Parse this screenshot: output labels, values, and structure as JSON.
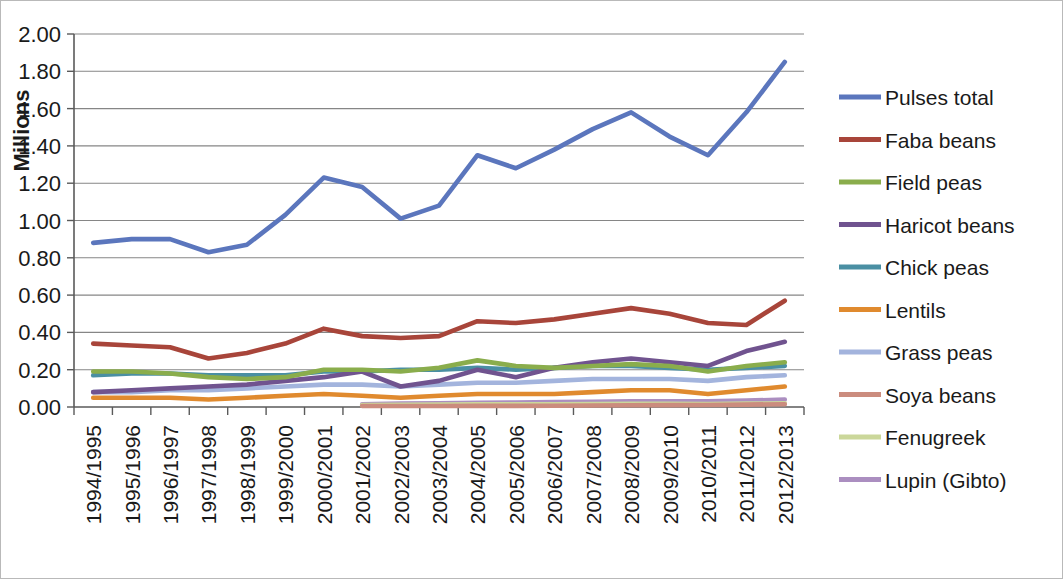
{
  "chart_data": {
    "type": "line",
    "title": "",
    "xlabel": "",
    "ylabel": "Millions",
    "ylim": [
      0.0,
      2.0
    ],
    "ytick_step": 0.2,
    "ytick_labels": [
      "0.00",
      "0.20",
      "0.40",
      "0.60",
      "0.80",
      "1.00",
      "1.20",
      "1.40",
      "1.60",
      "1.80",
      "2.00"
    ],
    "grid": true,
    "legend_position": "right",
    "categories": [
      "1994/1995",
      "1995/1996",
      "1996/1997",
      "1997/1998",
      "1998/1999",
      "1999/2000",
      "2000/2001",
      "2001/2002",
      "2002/2003",
      "2003/2004",
      "2004/2005",
      "2005/2006",
      "2006/2007",
      "2007/2008",
      "2008/2009",
      "2009/2010",
      "2010/2011",
      "2011/2012",
      "2012/2013"
    ],
    "series": [
      {
        "name": "Pulses total",
        "color": "#5b76bd",
        "values": [
          0.88,
          0.9,
          0.9,
          0.83,
          0.87,
          1.03,
          1.23,
          1.18,
          1.01,
          1.08,
          1.35,
          1.28,
          1.38,
          1.49,
          1.58,
          1.45,
          1.35,
          1.58,
          1.85
        ]
      },
      {
        "name": "Faba beans",
        "color": "#a8453a",
        "values": [
          0.34,
          0.33,
          0.32,
          0.26,
          0.29,
          0.34,
          0.42,
          0.38,
          0.37,
          0.38,
          0.46,
          0.45,
          0.47,
          0.5,
          0.53,
          0.5,
          0.45,
          0.44,
          0.57
        ]
      },
      {
        "name": "Field peas",
        "color": "#8aad4c",
        "values": [
          0.19,
          0.19,
          0.18,
          0.16,
          0.15,
          0.16,
          0.2,
          0.2,
          0.19,
          0.21,
          0.25,
          0.22,
          0.21,
          0.22,
          0.23,
          0.22,
          0.19,
          0.22,
          0.24
        ]
      },
      {
        "name": "Haricot beans",
        "color": "#70538f",
        "values": [
          0.08,
          0.09,
          0.1,
          0.11,
          0.12,
          0.14,
          0.16,
          0.19,
          0.11,
          0.14,
          0.2,
          0.16,
          0.21,
          0.24,
          0.26,
          0.24,
          0.22,
          0.3,
          0.35
        ]
      },
      {
        "name": "Chick peas",
        "color": "#4a8fa3",
        "values": [
          0.17,
          0.18,
          0.18,
          0.17,
          0.17,
          0.17,
          0.19,
          0.19,
          0.2,
          0.2,
          0.21,
          0.2,
          0.21,
          0.22,
          0.22,
          0.21,
          0.2,
          0.21,
          0.22
        ]
      },
      {
        "name": "Lentils",
        "color": "#e08a2e",
        "values": [
          0.05,
          0.05,
          0.05,
          0.04,
          0.05,
          0.06,
          0.07,
          0.06,
          0.05,
          0.06,
          0.07,
          0.07,
          0.07,
          0.08,
          0.09,
          0.09,
          0.07,
          0.09,
          0.11
        ]
      },
      {
        "name": "Grass peas",
        "color": "#a3b4dd",
        "values": [
          0.08,
          0.08,
          0.09,
          0.09,
          0.1,
          0.11,
          0.12,
          0.12,
          0.11,
          0.12,
          0.13,
          0.13,
          0.14,
          0.15,
          0.15,
          0.15,
          0.14,
          0.16,
          0.17
        ]
      },
      {
        "name": "Soya beans",
        "color": "#cb8c7e",
        "values": [
          null,
          null,
          null,
          null,
          null,
          null,
          null,
          0.005,
          0.005,
          0.005,
          0.006,
          0.006,
          0.007,
          0.008,
          0.009,
          0.01,
          0.011,
          0.013,
          0.015
        ]
      },
      {
        "name": "Fenugreek",
        "color": "#cbd79a",
        "values": [
          null,
          null,
          null,
          null,
          null,
          null,
          null,
          0.01,
          0.012,
          0.013,
          0.014,
          0.014,
          0.015,
          0.016,
          0.017,
          0.017,
          0.016,
          0.018,
          0.02
        ]
      },
      {
        "name": "Lupin (Gibto)",
        "color": "#ab8ec0",
        "values": [
          null,
          null,
          null,
          null,
          null,
          null,
          null,
          0.015,
          0.018,
          0.02,
          0.022,
          0.024,
          0.026,
          0.028,
          0.03,
          0.031,
          0.03,
          0.034,
          0.04
        ]
      }
    ]
  }
}
